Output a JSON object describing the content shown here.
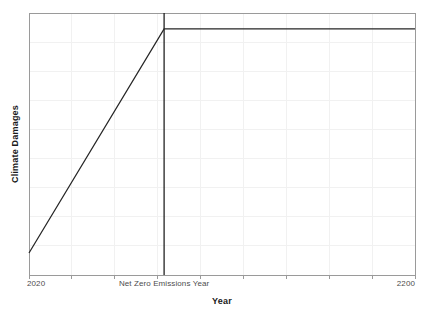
{
  "chart_data": {
    "type": "line",
    "title": "",
    "subtitle": "",
    "xlabel": "Year",
    "ylabel": "Climate Damages",
    "xlim": [
      2020,
      2200
    ],
    "ylim": [
      0,
      1
    ],
    "grid": true,
    "legend": null,
    "x_tick_labels": [
      "2020",
      "Net Zero Emissions Year",
      "2200"
    ],
    "x_tick_values": [
      2020,
      2083,
      2200
    ],
    "y_tick_labels": [],
    "series": [
      {
        "name": "Climate Damages",
        "color": "#262626",
        "x": [
          2020,
          2083,
          2200
        ],
        "values": [
          0.084,
          0.939,
          0.939
        ]
      }
    ],
    "annotations": [
      {
        "name": "net-zero-emissions-year",
        "type": "vertical-line",
        "x": 2083,
        "label": "Net Zero Emissions Year",
        "color": "#1a1a1a"
      }
    ],
    "grid_counts": {
      "vertical": 9,
      "horizontal": 9
    },
    "colors": {
      "line": "#262626",
      "vline": "#1a1a1a",
      "grid": "#f0f0f0",
      "frame": "#9a9a9a",
      "tick_text": "#4d4d4d",
      "axis_title": "#1a1a1a",
      "background": "#ffffff"
    }
  },
  "axes": {
    "x_title": "Year",
    "y_title": "Climate Damages",
    "tick_left": "2020",
    "tick_mid": "Net Zero Emissions Year",
    "tick_right": "2200"
  }
}
